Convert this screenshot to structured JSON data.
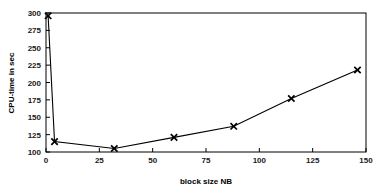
{
  "chart_data": {
    "type": "line",
    "title": "",
    "xlabel": "block size NB",
    "ylabel": "CPU-time in sec",
    "xlim": [
      0,
      150
    ],
    "ylim": [
      100,
      300
    ],
    "xticks": [
      0,
      25,
      50,
      75,
      100,
      125,
      150
    ],
    "yticks": [
      100,
      125,
      150,
      175,
      200,
      225,
      250,
      275,
      300
    ],
    "xtick_labels": [
      "0",
      "25",
      "50",
      "75",
      "100",
      "125",
      "150"
    ],
    "ytick_labels": [
      "100",
      "125",
      "150",
      "175",
      "200",
      "225",
      "250",
      "275",
      "300"
    ],
    "grid": false,
    "legend": null,
    "marker": "x",
    "line_color": "#000000",
    "marker_color": "#000000",
    "frame_color": "#000000",
    "background": "#ffffff",
    "series": [
      {
        "name": "CPU-time",
        "x": [
          1,
          4,
          32,
          60,
          88,
          115,
          146
        ],
        "values": [
          296,
          115,
          105,
          121,
          137,
          177,
          218
        ]
      }
    ]
  }
}
